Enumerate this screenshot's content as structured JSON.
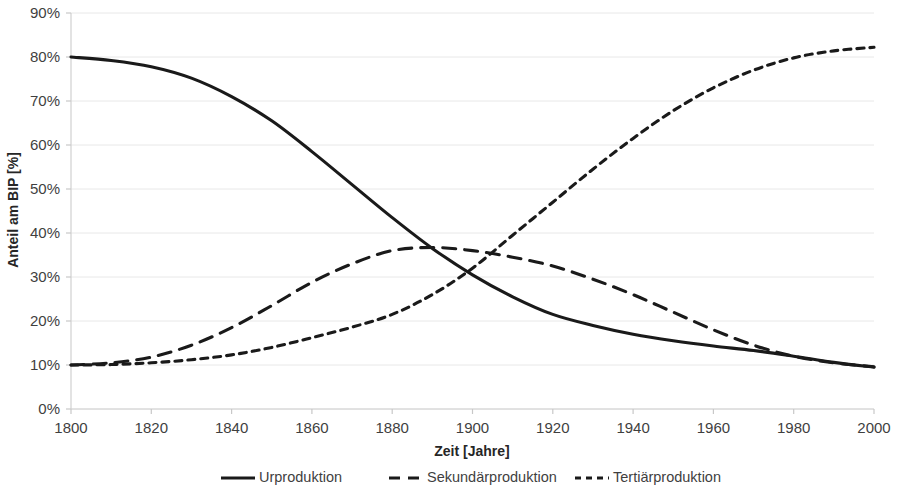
{
  "chart_data": {
    "type": "line",
    "title": "",
    "subtitle": "",
    "xlabel": "Zeit [Jahre]",
    "ylabel": "Anteil am BIP [%]",
    "xlim": [
      1800,
      2000
    ],
    "ylim": [
      0,
      90
    ],
    "xticks": [
      1800,
      1820,
      1840,
      1860,
      1880,
      1900,
      1920,
      1940,
      1960,
      1980,
      2000
    ],
    "xtick_labels": [
      "1800",
      "1820",
      "1840",
      "1860",
      "1880",
      "1900",
      "1920",
      "1940",
      "1960",
      "1980",
      "2000"
    ],
    "yticks": [
      0,
      10,
      20,
      30,
      40,
      50,
      60,
      70,
      80,
      90
    ],
    "ytick_labels": [
      "0%",
      "10%",
      "20%",
      "30%",
      "40%",
      "50%",
      "60%",
      "70%",
      "80%",
      "90%"
    ],
    "grid": true,
    "grid_axis": "y",
    "legend_position": "bottom",
    "line_color": "#1a1a1a",
    "grid_color": "#e8e8e8",
    "x": [
      1800,
      1810,
      1820,
      1830,
      1840,
      1850,
      1860,
      1870,
      1880,
      1890,
      1900,
      1910,
      1920,
      1930,
      1940,
      1950,
      1960,
      1970,
      1980,
      1990,
      2000
    ],
    "series": [
      {
        "name": "Urproduktion",
        "style": "solid",
        "values": [
          80.0,
          79.2,
          77.8,
          75.2,
          71.0,
          65.5,
          58.5,
          51.0,
          43.5,
          36.5,
          30.5,
          25.5,
          21.5,
          19.0,
          17.0,
          15.5,
          14.3,
          13.3,
          12.0,
          10.6,
          9.5
        ]
      },
      {
        "name": "Sekundärproduktion",
        "style": "dashed-long",
        "values": [
          10.0,
          10.5,
          11.8,
          14.5,
          18.5,
          23.5,
          28.8,
          33.0,
          36.0,
          36.7,
          36.0,
          34.5,
          32.5,
          29.5,
          26.0,
          22.0,
          18.0,
          14.5,
          12.0,
          10.5,
          9.6
        ]
      },
      {
        "name": "Tertiärproduktion",
        "style": "dashed-short",
        "values": [
          10.0,
          10.1,
          10.5,
          11.2,
          12.3,
          14.0,
          16.2,
          18.6,
          21.5,
          26.0,
          32.0,
          39.5,
          47.0,
          54.5,
          61.5,
          67.8,
          73.0,
          77.0,
          79.8,
          81.4,
          82.2
        ]
      }
    ]
  },
  "axes": {
    "y_title": "Anteil am BIP [%]",
    "x_title": "Zeit [Jahre]"
  },
  "legend": {
    "items": [
      {
        "label": "Urproduktion",
        "marker": "solid-line-icon"
      },
      {
        "label": "Sekundärproduktion",
        "marker": "long-dashed-line-icon"
      },
      {
        "label": "Tertiärproduktion",
        "marker": "short-dashed-line-icon"
      }
    ]
  }
}
